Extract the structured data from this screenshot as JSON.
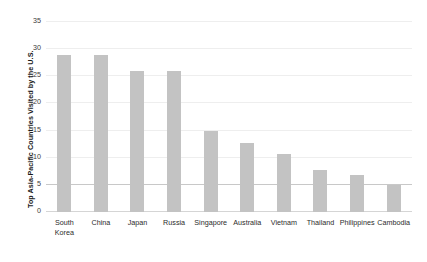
{
  "chart_data": {
    "type": "bar",
    "title": "",
    "subtitle": "",
    "xlabel": "",
    "ylabel": "Top Asia-Pacific Countries Visited by the U.S.",
    "categories": [
      "South\nKorea",
      "China",
      "Japan",
      "Russia",
      "Singapore",
      "Australia",
      "Vietnam",
      "Thailand",
      "Philippines",
      "Cambodia"
    ],
    "values": [
      29,
      29,
      26,
      26,
      15,
      12.8,
      10.7,
      7.8,
      6.8,
      5
    ],
    "ylim": [
      0,
      35
    ],
    "yticks": [
      0,
      5,
      10,
      15,
      20,
      25,
      30,
      35
    ],
    "ytick_labels": [
      "0",
      "5",
      "10",
      "15",
      "20",
      "25",
      "30",
      "35"
    ],
    "grid": true,
    "grid_axis": "y",
    "legend": false,
    "legend_position": "none",
    "bar_color": "#c3c3c3",
    "grid_color": "#eeeeee",
    "axis_color": "#d5d5d5",
    "text_color": "#2b2b2b"
  }
}
